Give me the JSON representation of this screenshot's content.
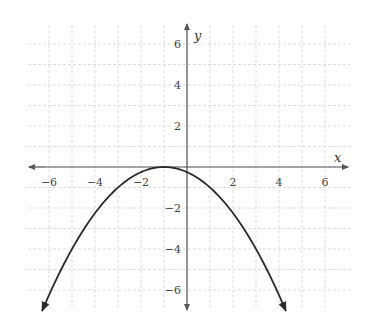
{
  "chart_data": {
    "type": "line",
    "title": "",
    "xlabel": "x",
    "ylabel": "y",
    "xlim": [
      -7,
      7
    ],
    "ylim": [
      -7,
      7
    ],
    "grid": true,
    "x_ticks": [
      -6,
      -4,
      -2,
      2,
      4,
      6
    ],
    "y_ticks": [
      6,
      4,
      2,
      -2,
      -4,
      -6
    ],
    "x_tick_labels": [
      "−6",
      "−4",
      "−2",
      "2",
      "4",
      "6"
    ],
    "y_tick_labels": [
      "6",
      "4",
      "2",
      "−2",
      "−4",
      "−6"
    ],
    "series": [
      {
        "name": "parabola",
        "equation": "y = -(1/4)(x + 1)^2",
        "vertex": [
          -1,
          0
        ],
        "opens": "down",
        "arrows_at_ends": true,
        "x": [
          -6.3,
          -5,
          -4,
          -3,
          -2,
          -1,
          0,
          1,
          2,
          3,
          4,
          4.3
        ],
        "y": [
          -7.0,
          -4.0,
          -2.25,
          -1.0,
          -0.25,
          0,
          -0.25,
          -1.0,
          -2.25,
          -4.0,
          -6.25,
          -7.0
        ]
      }
    ],
    "colors": {
      "curve": "#2a2a2a",
      "axes": "#555555",
      "grid": "#dddddd",
      "labels": "#444444"
    }
  }
}
